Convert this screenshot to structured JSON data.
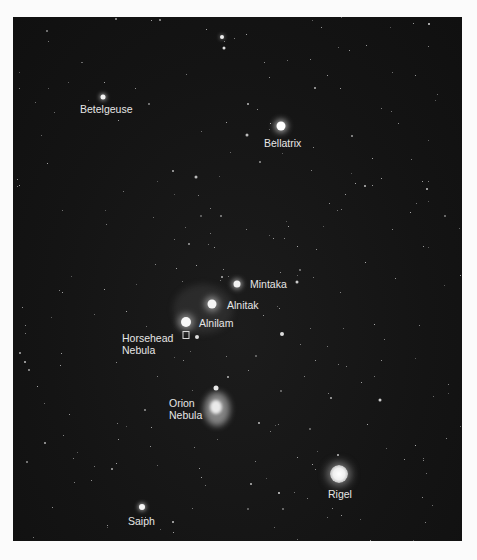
{
  "image": {
    "subject": "Orion constellation star field",
    "background_color": "#141414",
    "frame_color": "#fbfbfb"
  },
  "stars": [
    {
      "name": "Betelgeuse",
      "label": "Betelgeuse",
      "x": 103,
      "y": 97,
      "size": 5,
      "label_x": 80,
      "label_y": 103
    },
    {
      "name": "Bellatrix",
      "label": "Bellatrix",
      "x": 281,
      "y": 126,
      "size": 9,
      "label_x": 264,
      "label_y": 137
    },
    {
      "name": "Mintaka",
      "label": "Mintaka",
      "x": 237,
      "y": 284,
      "size": 7,
      "label_x": 250,
      "label_y": 278
    },
    {
      "name": "Alnitak",
      "label": "Alnitak",
      "x": 212,
      "y": 304,
      "size": 9,
      "label_x": 227,
      "label_y": 299
    },
    {
      "name": "Alnilam",
      "label": "Alnilam",
      "x": 186,
      "y": 322,
      "size": 10,
      "label_x": 199,
      "label_y": 317
    },
    {
      "name": "Rigel",
      "label": "Rigel",
      "x": 339,
      "y": 474,
      "size": 18,
      "label_x": 327,
      "label_y": 488
    },
    {
      "name": "Saiph",
      "label": "Saiph",
      "x": 142,
      "y": 507,
      "size": 6,
      "label_x": 128,
      "label_y": 515
    }
  ],
  "nebulae": [
    {
      "name": "Horsehead Nebula",
      "label_line1": "Horsehead",
      "label_line2": "Nebula",
      "marker_x": 186,
      "marker_y": 335,
      "label_x": 122,
      "label_y": 332
    },
    {
      "name": "Orion Nebula",
      "label_line1": "Orion",
      "label_line2": "Nebula",
      "x": 216,
      "y": 408,
      "label_x": 168,
      "label_y": 397
    }
  ]
}
